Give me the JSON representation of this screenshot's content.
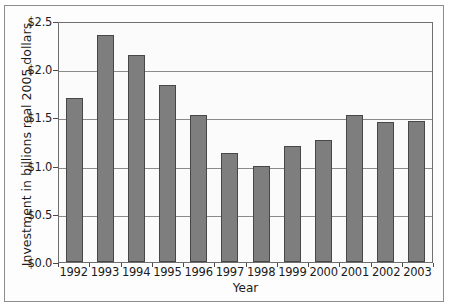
{
  "chart_data": {
    "type": "bar",
    "title": "",
    "xlabel": "Year",
    "ylabel": "Investment in billions real 2005 dollars",
    "categories": [
      "1992",
      "1993",
      "1994",
      "1995",
      "1996",
      "1997",
      "1998",
      "1999",
      "2000",
      "2001",
      "2002",
      "2003"
    ],
    "values": [
      1.7,
      2.35,
      2.15,
      1.84,
      1.52,
      1.13,
      1.0,
      1.2,
      1.27,
      1.52,
      1.45,
      1.46
    ],
    "ylim": [
      0.0,
      2.5
    ],
    "ytick_values": [
      0.0,
      0.5,
      1.0,
      1.5,
      2.0,
      2.5
    ],
    "ytick_labels": [
      "$0.0",
      "$0.5",
      "$1.0",
      "$1.5",
      "$2.0",
      "$2.5"
    ],
    "grid": true,
    "legend": null,
    "bar_color": "#7e7e7e",
    "bar_edge_color": "#474747",
    "axis_color": "#6f6f6f",
    "gridline_color": "#8a8a8a",
    "background_color": "#fbfbfb"
  }
}
